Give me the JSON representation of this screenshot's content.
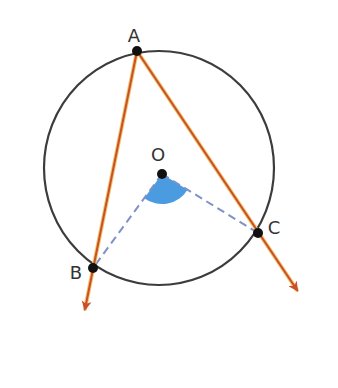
{
  "diagram": {
    "title": "",
    "circle": {
      "cx": 159,
      "cy": 168,
      "rx": 115,
      "ry": 117,
      "stroke": "#3c3c3c",
      "width": 2.2
    },
    "center": {
      "name": "O",
      "x": 162,
      "y": 174
    },
    "points": [
      {
        "name": "A",
        "x": 137,
        "y": 51,
        "label_x": 134,
        "label_y": 36
      },
      {
        "name": "B",
        "x": 93,
        "y": 268,
        "label_x": 76,
        "label_y": 273
      },
      {
        "name": "C",
        "x": 258,
        "y": 233,
        "label_x": 274,
        "label_y": 228
      }
    ],
    "center_label": {
      "text": "O",
      "x": 158,
      "y": 155
    },
    "rays": [
      {
        "from": "A",
        "through": "B",
        "tip_x": 85,
        "tip_y": 309
      },
      {
        "from": "A",
        "through": "C",
        "tip_x": 297,
        "tip_y": 290
      }
    ],
    "radii_dashed": [
      "OB",
      "OC"
    ],
    "central_angle": {
      "vertex": "O",
      "between": [
        "B",
        "C"
      ],
      "fill": "#4a9be0",
      "radius": 30
    },
    "colors": {
      "ray": "#c8502a",
      "ray_glow": "#f2c46a",
      "dashed": "#7f92c8",
      "point": "#111111",
      "sector": "#4a9be0",
      "label": "#333333"
    }
  }
}
